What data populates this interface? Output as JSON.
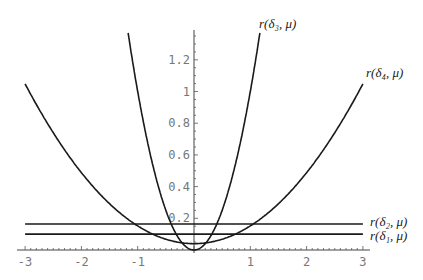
{
  "chart_data": {
    "type": "line",
    "title": "",
    "xlabel": "",
    "ylabel": "",
    "xlim": [
      -3,
      3
    ],
    "ylim": [
      0,
      1.38
    ],
    "grid": false,
    "x_ticks": [
      "-3",
      "-2",
      "-1",
      "1",
      "2",
      "3"
    ],
    "y_ticks": [
      "0.2",
      "0.4",
      "0.6",
      "0.8",
      "1",
      "1.2"
    ],
    "series": [
      {
        "name": "r(δ1, μ)",
        "formula": "constant",
        "x": [
          -3,
          0,
          3
        ],
        "values": [
          0.1,
          0.1,
          0.1
        ]
      },
      {
        "name": "r(δ2, μ)",
        "formula": "constant",
        "x": [
          -3,
          0,
          3
        ],
        "values": [
          0.164,
          0.164,
          0.164
        ]
      },
      {
        "name": "r(δ3, μ)",
        "formula": "mu^2",
        "x": [
          -1.17,
          -1,
          -0.5,
          0,
          0.5,
          1,
          1.17
        ],
        "values": [
          1.37,
          1.0,
          0.25,
          0.0,
          0.25,
          1.0,
          1.37
        ]
      },
      {
        "name": "r(δ4, μ)",
        "formula": "0.04 + 0.112*mu^2",
        "x": [
          -3,
          -2,
          -1,
          0,
          1,
          2,
          3
        ],
        "values": [
          1.05,
          0.49,
          0.15,
          0.04,
          0.15,
          0.49,
          1.05
        ]
      }
    ],
    "annotations": [
      {
        "text": "r(δ3, μ)",
        "near": "top of δ3 curve, right branch"
      },
      {
        "text": "r(δ4, μ)",
        "near": "right end of δ4 curve"
      },
      {
        "text": "r(δ2, μ)",
        "near": "right end of upper horizontal line"
      },
      {
        "text": "r(δ1, μ)",
        "near": "right end of lower horizontal line"
      }
    ]
  },
  "labels": {
    "d3": "r(δ₃, μ)",
    "d4": "r(δ₄, μ)",
    "d2": "r(δ₂, μ)",
    "d1": "r(δ₁, μ)"
  }
}
